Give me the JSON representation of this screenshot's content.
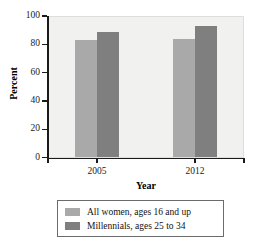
{
  "chart_data": {
    "type": "bar",
    "title": "",
    "xlabel": "Year",
    "ylabel": "Percent",
    "categories": [
      "2005",
      "2012"
    ],
    "series": [
      {
        "name": "All women, ages 16 and up",
        "color": "#a9a9a9",
        "values": [
          83,
          84
        ]
      },
      {
        "name": "Millennials, ages 25 to 34",
        "color": "#7f7f7f",
        "values": [
          89,
          93
        ]
      }
    ],
    "ylim": [
      0,
      100
    ],
    "yticks": [
      0,
      20,
      40,
      60,
      80,
      100
    ],
    "ytick_labels": [
      "0",
      "20",
      "40",
      "60",
      "80",
      "100"
    ],
    "grid": false,
    "legend_position": "bottom",
    "plot_background": "#f1f1ef"
  },
  "axis": {
    "y_title": "Percent",
    "x_title": "Year"
  },
  "legend": {
    "entries": [
      {
        "label": "All women, ages 16 and up",
        "color": "#a9a9a9"
      },
      {
        "label": "Millennials, ages 25 to 34",
        "color": "#7f7f7f"
      }
    ]
  }
}
